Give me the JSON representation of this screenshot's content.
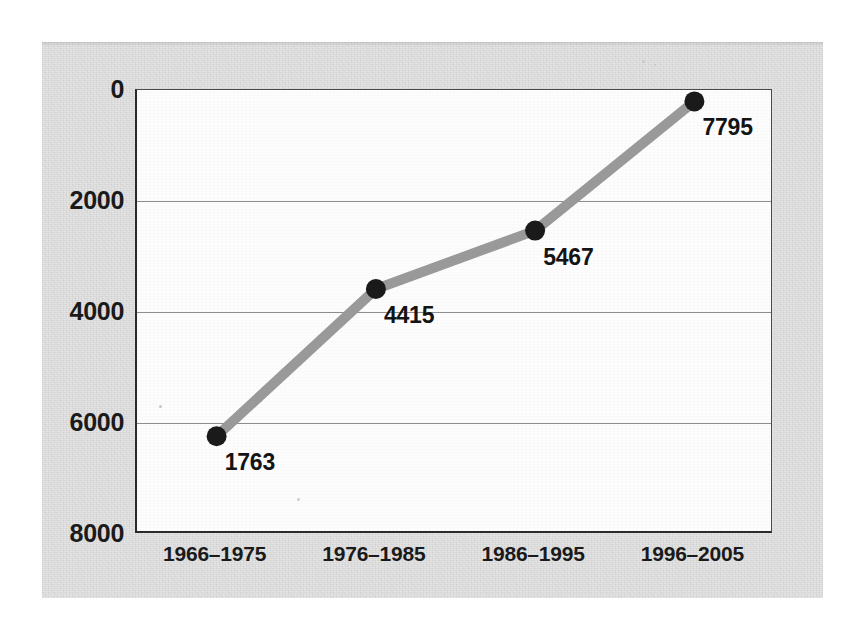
{
  "chart_data": {
    "type": "line",
    "title": "",
    "subtitle": "",
    "xlabel": "",
    "ylabel": "",
    "categories": [
      "1966–1975",
      "1976–1985",
      "1986–1995",
      "1996–2005"
    ],
    "values": [
      1763,
      4415,
      5467,
      7795
    ],
    "point_labels": [
      "1763",
      "4415",
      "5467",
      "7795"
    ],
    "series": [
      {
        "name": "",
        "values": [
          1763,
          4415,
          5467,
          7795
        ]
      }
    ],
    "ylim": [
      0,
      8000
    ],
    "yticks": [
      0,
      2000,
      4000,
      6000,
      8000
    ],
    "ytick_labels": [
      "0",
      "2000",
      "4000",
      "6000",
      "8000"
    ],
    "xtick_labels": [
      "1966–1975",
      "1976–1985",
      "1986–1995",
      "1996–2005"
    ],
    "grid": true,
    "grid_axis": "y",
    "legend": false,
    "legend_position": "none",
    "annotations": []
  },
  "style": {
    "panel_background": "#dcdcdc",
    "plot_background": "#fdfdfd",
    "line_color": "#999999",
    "marker_color": "#1a1a1a",
    "gridline_color": "#8d8d8d",
    "axis_color": "#2a2a2a",
    "text_color": "#1a1a1a",
    "line_width_px": 10,
    "marker_radius_px": 10
  }
}
